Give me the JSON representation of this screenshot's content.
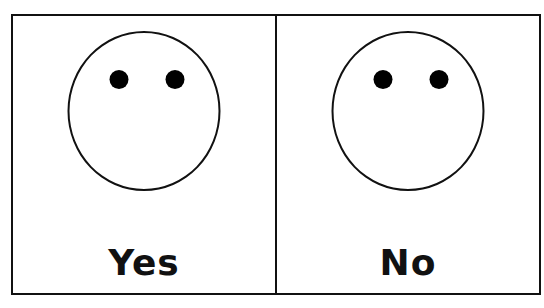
{
  "cards": [
    {
      "label": "Yes",
      "icon": "neutral-face-icon"
    },
    {
      "label": "No",
      "icon": "neutral-face-icon"
    }
  ],
  "colors": {
    "border": "#111111",
    "eyes": "#000000",
    "background": "#ffffff"
  }
}
